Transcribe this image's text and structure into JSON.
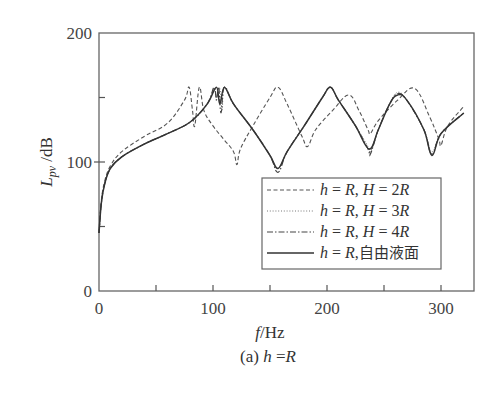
{
  "chart_data": {
    "type": "line",
    "title": "",
    "caption": "(a) h =R",
    "xlabel": "f/Hz",
    "ylabel": "L_pv /dB",
    "xlim": [
      0,
      330
    ],
    "ylim": [
      0,
      200
    ],
    "x_ticks": [
      0,
      100,
      200,
      300
    ],
    "x_minor_ticks": [
      50,
      150,
      250
    ],
    "y_ticks": [
      0,
      100,
      200
    ],
    "y_minor_ticks": [
      50,
      150
    ],
    "grid": false,
    "legend_position": "lower right inside",
    "series": [
      {
        "name": "h = R, H = 2R",
        "style": "dashed",
        "x": [
          0,
          2,
          5,
          10,
          20,
          40,
          60,
          75,
          79,
          82,
          84,
          88,
          92,
          100,
          110,
          118,
          121,
          124,
          135,
          150,
          157,
          165,
          178,
          183,
          190,
          205,
          219,
          228,
          236,
          238,
          245,
          262,
          277,
          290,
          298,
          300,
          306,
          320
        ],
        "y": [
          45,
          70,
          85,
          97,
          108,
          120,
          130,
          148,
          158,
          140,
          128,
          158,
          140,
          128,
          117,
          108,
          98,
          110,
          128,
          150,
          158,
          145,
          120,
          112,
          125,
          140,
          152,
          140,
          125,
          122,
          132,
          148,
          157,
          135,
          118,
          113,
          128,
          143
        ]
      },
      {
        "name": "h = R, H = 3R",
        "style": "dotted",
        "x": [
          0,
          2,
          5,
          10,
          20,
          40,
          60,
          80,
          95,
          101,
          103,
          106,
          108,
          110,
          118,
          135,
          150,
          157,
          165,
          180,
          196,
          203,
          210,
          225,
          236,
          238,
          245,
          255,
          262,
          270,
          285,
          292,
          300,
          320
        ],
        "y": [
          45,
          68,
          83,
          95,
          104,
          114,
          122,
          131,
          145,
          157,
          150,
          157,
          140,
          158,
          145,
          125,
          105,
          95,
          108,
          128,
          150,
          158,
          148,
          128,
          112,
          108,
          125,
          145,
          154,
          148,
          125,
          108,
          122,
          138
        ]
      },
      {
        "name": "h = R, H = 4R",
        "style": "dashdot",
        "x": [
          0,
          2,
          5,
          10,
          20,
          40,
          60,
          80,
          95,
          101,
          103,
          105,
          107,
          110,
          118,
          135,
          150,
          157,
          165,
          180,
          196,
          203,
          210,
          225,
          236,
          238,
          245,
          255,
          262,
          270,
          285,
          292,
          300,
          320
        ],
        "y": [
          45,
          68,
          83,
          95,
          104,
          114,
          122,
          131,
          145,
          158,
          148,
          158,
          138,
          158,
          145,
          125,
          105,
          92,
          108,
          128,
          150,
          158,
          148,
          128,
          110,
          106,
          125,
          145,
          153,
          148,
          125,
          106,
          122,
          138
        ]
      },
      {
        "name": "h = R,自由液面",
        "style": "solid",
        "x": [
          0,
          2,
          5,
          10,
          20,
          40,
          60,
          80,
          95,
          103,
          106,
          110,
          118,
          135,
          150,
          157,
          165,
          180,
          196,
          203,
          210,
          225,
          237,
          245,
          255,
          262,
          270,
          285,
          292,
          300,
          320
        ],
        "y": [
          45,
          68,
          83,
          95,
          104,
          114,
          122,
          131,
          145,
          158,
          145,
          158,
          145,
          125,
          105,
          95,
          108,
          128,
          150,
          158,
          148,
          128,
          110,
          125,
          145,
          152,
          148,
          125,
          105,
          122,
          138
        ]
      }
    ]
  },
  "axes": {
    "x_tick_labels": [
      "0",
      "100",
      "200",
      "300"
    ],
    "y_tick_labels": [
      "0",
      "100",
      "200"
    ],
    "xlabel_italic": "f",
    "xlabel_unit": "/Hz",
    "ylabel_main": "L",
    "ylabel_sub": "pv",
    "ylabel_unit": " /dB"
  },
  "legend": {
    "items": [
      {
        "prefix": "h",
        "eq1": " = ",
        "R": "R",
        "sep": ", ",
        "H": "H",
        "eq2": " = ",
        "val": "2R",
        "style": "dashed"
      },
      {
        "prefix": "h",
        "eq1": " = ",
        "R": "R",
        "sep": ", ",
        "H": "H",
        "eq2": " = ",
        "val": "3R",
        "style": "dotted"
      },
      {
        "prefix": "h",
        "eq1": " = ",
        "R": "R",
        "sep": ", ",
        "H": "H",
        "eq2": " = ",
        "val": "4R",
        "style": "dashdot"
      },
      {
        "prefix": "h",
        "eq1": " = ",
        "R": "R",
        "sep": ",",
        "cn": "自由液面",
        "style": "solid"
      }
    ]
  },
  "caption": {
    "prefix": "(a) ",
    "h": "h",
    "eq": " =",
    "R": "R"
  },
  "colors": {
    "axis": "#555555",
    "line": "#3a3a3a"
  }
}
